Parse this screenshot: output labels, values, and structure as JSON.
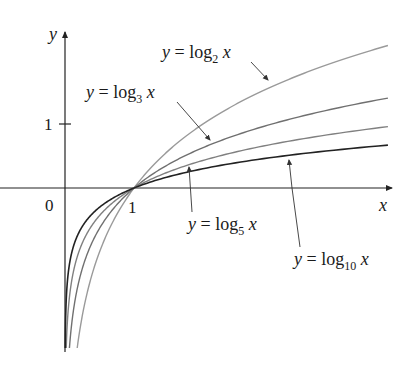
{
  "chart_data": {
    "type": "line",
    "title": "",
    "xlabel": "x",
    "ylabel": "y",
    "origin_label": "0",
    "x_ticks": [
      {
        "value": 1,
        "label": "1"
      }
    ],
    "y_ticks": [
      {
        "value": 1,
        "label": "1"
      }
    ],
    "xlim": [
      0,
      4.7
    ],
    "ylim": [
      -2.5,
      2.4
    ],
    "grid": false,
    "legend": "none (curves labeled with arrows)",
    "series": [
      {
        "name": "y = log_2 x",
        "base": 2,
        "color": "#9a9a9a",
        "label_main": "y = log",
        "label_sub": "2",
        "label_end": " x",
        "points": [
          [
            0.1,
            -3.32
          ],
          [
            0.5,
            -1
          ],
          [
            1,
            0
          ],
          [
            2,
            1
          ],
          [
            3,
            1.58
          ],
          [
            4,
            2
          ],
          [
            4.68,
            2.23
          ]
        ]
      },
      {
        "name": "y = log_3 x",
        "base": 3,
        "color": "#707070",
        "label_main": "y = log",
        "label_sub": "3",
        "label_end": " x",
        "points": [
          [
            0.1,
            -2.1
          ],
          [
            0.5,
            -0.63
          ],
          [
            1,
            0
          ],
          [
            2,
            0.63
          ],
          [
            3,
            1
          ],
          [
            4,
            1.26
          ],
          [
            4.68,
            1.4
          ]
        ]
      },
      {
        "name": "y = log_5 x",
        "base": 5,
        "color": "#808080",
        "label_main": "y = log",
        "label_sub": "5",
        "label_end": " x",
        "points": [
          [
            0.1,
            -1.43
          ],
          [
            0.5,
            -0.43
          ],
          [
            1,
            0
          ],
          [
            2,
            0.43
          ],
          [
            3,
            0.68
          ],
          [
            4,
            0.86
          ],
          [
            4.68,
            0.96
          ]
        ]
      },
      {
        "name": "y = log_10 x",
        "base": 10,
        "color": "#222222",
        "label_main": "y = log",
        "label_sub": "10",
        "label_end": " x",
        "points": [
          [
            0.1,
            -1
          ],
          [
            0.5,
            -0.3
          ],
          [
            1,
            0
          ],
          [
            2,
            0.3
          ],
          [
            3,
            0.48
          ],
          [
            4,
            0.6
          ],
          [
            4.68,
            0.67
          ]
        ]
      }
    ]
  },
  "axes": {
    "x_label": "x",
    "y_label": "y",
    "origin": "0",
    "x_tick_1": "1",
    "y_tick_1": "1"
  },
  "labels": {
    "log2": {
      "pre": "y = log",
      "sub": "2",
      "post": " x"
    },
    "log3": {
      "pre": "y = log",
      "sub": "3",
      "post": " x"
    },
    "log5": {
      "pre": "y = log",
      "sub": "5",
      "post": " x"
    },
    "log10": {
      "pre": "y = log",
      "sub": "10",
      "post": " x"
    }
  }
}
